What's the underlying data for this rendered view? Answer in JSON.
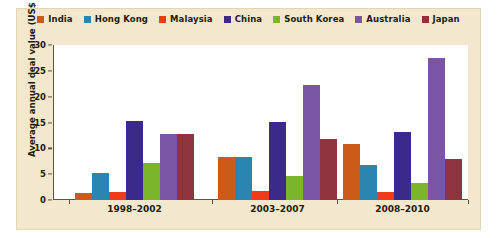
{
  "chart_data": {
    "type": "bar",
    "title": "",
    "subtitle": "",
    "xlabel": "",
    "ylabel": "Average annual deal value (US$ B)",
    "categories": [
      "1998–2002",
      "2003–2007",
      "2008–2010"
    ],
    "ylim": [
      0,
      30
    ],
    "yticks": [
      0,
      5,
      10,
      15,
      20,
      25,
      30
    ],
    "ytick_labels": [
      "0",
      "5",
      "10",
      "15",
      "20",
      "25",
      "30"
    ],
    "grid": false,
    "legend_position": "top",
    "series": [
      {
        "name": "India",
        "color": "#cc5a18",
        "values": [
          1.3,
          8.3,
          10.8
        ]
      },
      {
        "name": "Hong Kong",
        "color": "#2a85b0",
        "values": [
          5.3,
          8.4,
          6.7
        ]
      },
      {
        "name": "Malaysia",
        "color": "#ef3b18",
        "values": [
          1.6,
          1.8,
          1.6
        ]
      },
      {
        "name": "China",
        "color": "#3b2a8c",
        "values": [
          15.3,
          15.1,
          13.1
        ]
      },
      {
        "name": "South Korea",
        "color": "#7ab52c",
        "values": [
          7.1,
          4.7,
          3.3
        ]
      },
      {
        "name": "Australia",
        "color": "#7b54a8",
        "values": [
          12.7,
          22.2,
          27.4
        ]
      },
      {
        "name": "Japan",
        "color": "#8e333f",
        "values": [
          12.7,
          11.8,
          8.0
        ]
      }
    ]
  },
  "style": {
    "panel_background": "#f3e8cd",
    "plot_background": "#ffffff",
    "axis_color": "#5d5243",
    "text_color": "#221d10"
  }
}
